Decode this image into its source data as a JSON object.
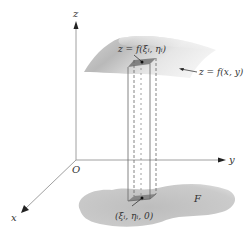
{
  "figure": {
    "type": "3d-double-integral-diagram",
    "axes": {
      "x_label": "x",
      "y_label": "y",
      "z_label": "z",
      "origin_label": "O"
    },
    "labels": {
      "surface_point": "z = f(ξᵢ, ηᵢ)",
      "surface": "z = f(x, y)",
      "base_point": "(ξᵢ, ηᵢ, 0)",
      "region": "F"
    },
    "colors": {
      "axis": "#9a9a9a",
      "arrow": "#222222",
      "surface_light": "#f2f2f2",
      "surface_dark": "#b8b8b8",
      "region_fill": "#c4c4c4",
      "prism_line": "#666666",
      "text": "#333333"
    }
  }
}
